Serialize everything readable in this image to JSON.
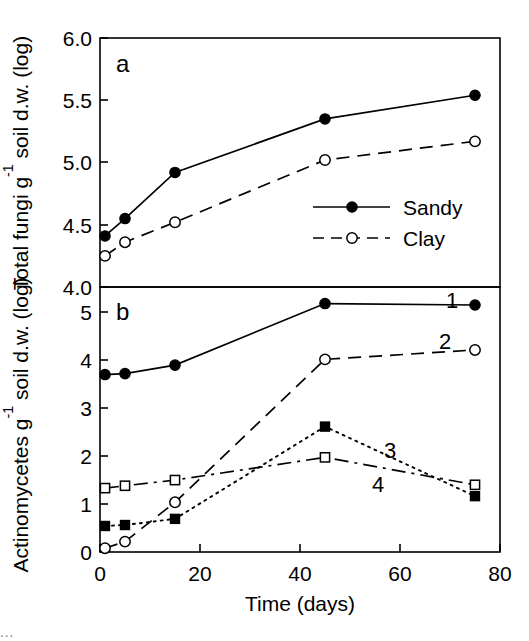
{
  "figure": {
    "panels": [
      {
        "letter": "a"
      },
      {
        "letter": "b"
      }
    ],
    "xlabel": "Time (days)",
    "ylabel_top": "Total fungi g",
    "ylabel_top_sup": "-1",
    "ylabel_top_rest": " soil d.w. (log)",
    "ylabel_bottom": "Actinomycetes g",
    "ylabel_bottom_sup": "-1",
    "ylabel_bottom_rest": " soil d.w. (log)",
    "caption_fragment": "..."
  },
  "legend": {
    "entries": [
      {
        "label": "Sandy",
        "marker": "filled-circle",
        "line": "solid"
      },
      {
        "label": "Clay",
        "marker": "open-circle",
        "line": "dashed"
      }
    ]
  },
  "series_labels": {
    "one": "1",
    "two": "2",
    "three": "3",
    "four": "4"
  },
  "xticks": [
    "0",
    "20",
    "40",
    "60",
    "80"
  ],
  "yticks_a": [
    "4.0",
    "4.5",
    "5.0",
    "5.5",
    "6.0"
  ],
  "yticks_b": [
    "0",
    "1",
    "2",
    "3",
    "4",
    "5"
  ],
  "chart_data": [
    {
      "type": "line",
      "panel": "a",
      "title": "",
      "xlabel": "Time (days)",
      "ylabel": "Total fungi g-1 soil d.w. (log)",
      "xlim": [
        0,
        80
      ],
      "ylim": [
        4.0,
        6.0
      ],
      "xticks": [
        0,
        20,
        40,
        60,
        80
      ],
      "yticks": [
        4.0,
        4.5,
        5.0,
        5.5,
        6.0
      ],
      "grid": false,
      "legend_position": "lower-right-inside",
      "x": [
        1,
        5,
        15,
        45,
        75
      ],
      "series": [
        {
          "name": "Sandy",
          "marker": "filled-circle",
          "linestyle": "solid",
          "values": [
            4.41,
            4.55,
            4.92,
            5.35,
            5.54
          ]
        },
        {
          "name": "Clay",
          "marker": "open-circle",
          "linestyle": "dashed",
          "values": [
            4.25,
            4.36,
            4.52,
            5.02,
            5.17
          ]
        }
      ]
    },
    {
      "type": "line",
      "panel": "b",
      "title": "",
      "xlabel": "Time (days)",
      "ylabel": "Actinomycetes g-1 soil d.w. (log)",
      "xlim": [
        0,
        80
      ],
      "ylim": [
        0,
        5.6
      ],
      "xticks": [
        0,
        20,
        40,
        60,
        80
      ],
      "yticks": [
        0,
        1,
        2,
        3,
        4,
        5
      ],
      "grid": false,
      "legend_position": "inline-end-labels",
      "x": [
        1,
        5,
        15,
        45,
        75
      ],
      "series": [
        {
          "name": "1",
          "marker": "filled-circle",
          "linestyle": "solid",
          "values": [
            3.75,
            3.77,
            3.95,
            5.25,
            5.22
          ]
        },
        {
          "name": "2",
          "marker": "open-circle",
          "linestyle": "dashed",
          "values": [
            0.08,
            0.22,
            1.05,
            4.07,
            4.27
          ]
        },
        {
          "name": "3",
          "marker": "filled-square",
          "linestyle": "dotted",
          "values": [
            0.55,
            0.57,
            0.7,
            2.65,
            1.18
          ]
        },
        {
          "name": "4",
          "marker": "open-square",
          "linestyle": "dashdot",
          "values": [
            1.35,
            1.4,
            1.52,
            2.0,
            1.42
          ]
        }
      ]
    }
  ],
  "colors": {
    "ink": "#000000",
    "background": "#ffffff"
  }
}
